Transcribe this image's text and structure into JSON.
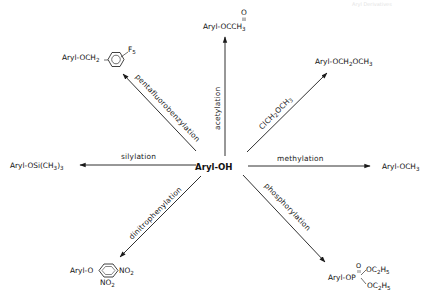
{
  "header": {
    "faint_text": "Aryl Derivatives"
  },
  "center": {
    "label": "Aryl-OH"
  },
  "reactions": [
    {
      "id": "acetylation",
      "label": "acetylation",
      "product": {
        "main": "Aryl-OCCH",
        "sub": "3",
        "carbonyl_o": "O"
      }
    },
    {
      "id": "chloromethyl-methyl-ether",
      "label_parts": [
        "ClCH",
        "2",
        "OCH",
        "3"
      ],
      "product": {
        "p1": "Aryl-OCH",
        "s1": "2",
        "p2": "OCH",
        "s2": "3"
      }
    },
    {
      "id": "methylation",
      "label": "methylation",
      "product": {
        "main": "Aryl-OCH",
        "sub": "3"
      }
    },
    {
      "id": "phosphorylation",
      "label": "phosphorylation",
      "product": {
        "main": "Aryl-OP",
        "o": "O",
        "e1": "OC",
        "e1s1": "2",
        "e1h": "H",
        "e1s2": "5",
        "e2": "OC",
        "e2s1": "2",
        "e2h": "H",
        "e2s2": "5"
      }
    },
    {
      "id": "dinitrophenylation",
      "label": "dinitrophenylation",
      "product": {
        "main": "Aryl-O",
        "no2_a": "NO",
        "no2_a_sub": "2",
        "no2_b": "NO",
        "no2_b_sub": "2"
      }
    },
    {
      "id": "silylation",
      "label": "silylation",
      "product": {
        "main": "Aryl-OSi(CH",
        "s1": "3",
        "close": ")",
        "s2": "3"
      }
    },
    {
      "id": "pentafluorobenzylation",
      "label": "pentafluorobenzylation",
      "product": {
        "main": "Aryl-OCH",
        "sub": "2",
        "f": "F",
        "f_sub": "5"
      }
    }
  ],
  "colors": {
    "ink": "#1a1a1a",
    "background": "#ffffff"
  }
}
